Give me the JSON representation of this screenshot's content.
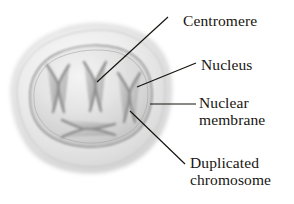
{
  "figure": {
    "background_color": "#ffffff",
    "text_color": "#17150f",
    "leader_line_color": "#14120d"
  },
  "labels": {
    "centromere": "Centromere",
    "nucleus": "Nucleus",
    "nuclear_membrane_line1": "Nuclear",
    "nuclear_membrane_line2": "membrane",
    "duplicated_chromosome_line1": "Duplicated",
    "duplicated_chromosome_line2": "chromosome"
  },
  "structures": {
    "cell": {
      "name": "cell-body",
      "fill_light": "#fbfbfb",
      "fill_mid": "#e6e6e6",
      "fill_dark": "#d2d2d2",
      "outline": "#b5b5b5"
    },
    "nucleus": {
      "name": "nucleus",
      "fill_light": "#f2f2f2",
      "fill_mid": "#dcdcdc",
      "fill_dark": "#c6c6c6",
      "outline": "#8f8f8f"
    },
    "nuclear_membrane": {
      "name": "nuclear-membrane",
      "outline": "#7c7c7c"
    },
    "chromosomes": {
      "count": 4,
      "stroke": "#6d6d6d",
      "fill": "#c9c9c9",
      "orientations": [
        "upright",
        "upright",
        "upright",
        "horizontal"
      ]
    },
    "centromere": {
      "name": "centromere",
      "description": "pinch point where sister chromatids cross"
    }
  },
  "leaders": [
    {
      "name": "centromere-leader",
      "from": [
        168,
        17
      ],
      "to": [
        97,
        82
      ]
    },
    {
      "name": "nucleus-leader",
      "from": [
        196,
        63
      ],
      "to": [
        137,
        87
      ]
    },
    {
      "name": "nuclear-membrane-leader",
      "from": [
        196,
        104
      ],
      "to": [
        150,
        104
      ]
    },
    {
      "name": "duplicated-chromosome-leader",
      "from": [
        185,
        164
      ],
      "to": [
        130,
        111
      ]
    }
  ]
}
